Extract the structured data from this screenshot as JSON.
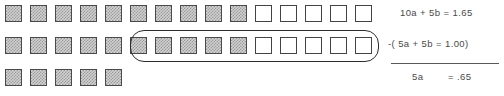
{
  "diagram": {
    "tile_glyph": "shaded-square",
    "rows": [
      {
        "id": "row-1",
        "label": "10a + 5b",
        "top": 5,
        "left": 5,
        "pitch": 25,
        "tiles": [
          "filled",
          "filled",
          "filled",
          "filled",
          "filled",
          "filled",
          "filled",
          "filled",
          "filled",
          "filled",
          "empty",
          "empty",
          "empty",
          "empty",
          "empty"
        ],
        "filled_count": 10,
        "empty_count": 5,
        "total": 15
      },
      {
        "id": "row-2",
        "label": "5a + 5b (subtracted)",
        "top": 37,
        "left": 5,
        "pitch": 25,
        "tiles": [
          "filled",
          "filled",
          "filled",
          "filled",
          "filled",
          "filled",
          "filled",
          "filled",
          "filled",
          "filled",
          "empty",
          "empty",
          "empty",
          "empty",
          "empty"
        ],
        "filled_count": 10,
        "empty_count": 5,
        "total": 15
      },
      {
        "id": "row-3",
        "label": "5a remaining",
        "top": 69,
        "left": 5,
        "pitch": 25,
        "tiles": [
          "filled",
          "filled",
          "filled",
          "filled",
          "filled"
        ],
        "filled_count": 5,
        "empty_count": 0,
        "total": 5
      }
    ],
    "group_oval": {
      "name": "grouping-oval",
      "row": "row-2",
      "left": 130,
      "top": 30,
      "width": 249,
      "height": 32,
      "enclosed_tiles": 10,
      "enclosed_filled": 5,
      "enclosed_empty": 5
    }
  },
  "equations": {
    "line1": "10a + 5b = 1.65",
    "line2": "-( 5a + 5b = 1.00)",
    "result_lhs": "5a",
    "result_rhs": "= .65",
    "rule": true
  },
  "colors": {
    "tile_fill": "#d2d2d2",
    "tile_hatch": "#9a9a9a",
    "tile_border": "#4a4a4a",
    "empty_border": "#444444",
    "oval_stroke": "#2c2c2c",
    "text": "#4a4a4a",
    "background": "#ffffff"
  }
}
